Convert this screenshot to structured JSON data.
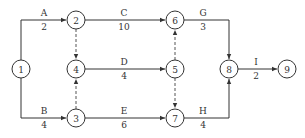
{
  "diagram": {
    "type": "activity-on-arrow network",
    "nodes": [
      {
        "id": "1",
        "x": 21,
        "y": 69
      },
      {
        "id": "2",
        "x": 76,
        "y": 20
      },
      {
        "id": "3",
        "x": 76,
        "y": 118
      },
      {
        "id": "4",
        "x": 76,
        "y": 69
      },
      {
        "id": "5",
        "x": 175,
        "y": 69
      },
      {
        "id": "6",
        "x": 175,
        "y": 20
      },
      {
        "id": "7",
        "x": 175,
        "y": 118
      },
      {
        "id": "8",
        "x": 229,
        "y": 69
      },
      {
        "id": "9",
        "x": 287,
        "y": 69
      }
    ],
    "activities": [
      {
        "name": "A",
        "duration": "2",
        "from": "1",
        "to": "2"
      },
      {
        "name": "B",
        "duration": "4",
        "from": "1",
        "to": "3"
      },
      {
        "name": "C",
        "duration": "10",
        "from": "2",
        "to": "6"
      },
      {
        "name": "D",
        "duration": "4",
        "from": "4",
        "to": "5"
      },
      {
        "name": "E",
        "duration": "6",
        "from": "3",
        "to": "7"
      },
      {
        "name": "G",
        "duration": "3",
        "from": "6",
        "to": "8"
      },
      {
        "name": "H",
        "duration": "4",
        "from": "7",
        "to": "8"
      },
      {
        "name": "I",
        "duration": "2",
        "from": "8",
        "to": "9"
      }
    ],
    "dummies": [
      {
        "from": "2",
        "to": "4"
      },
      {
        "from": "3",
        "to": "4"
      },
      {
        "from": "5",
        "to": "6"
      },
      {
        "from": "5",
        "to": "7"
      }
    ]
  }
}
